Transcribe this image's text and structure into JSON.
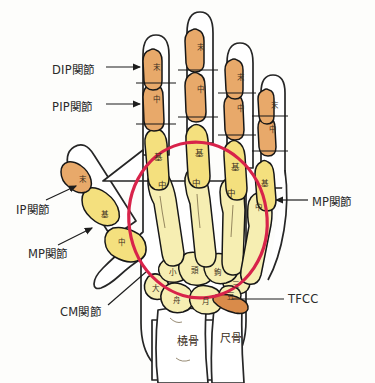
{
  "figure": {
    "colors": {
      "background": "#fdfdfb",
      "bone_pale_yellow": "#f6eeb2",
      "bone_yellow": "#f4e07e",
      "phalanx_orange": "#e8a96a",
      "tfcc_orange": "#d98b4a",
      "outline": "#171717",
      "skin_outline": "#262626",
      "highlight_circle": "#d8234a",
      "label_text": "#2b2b2b",
      "bone_tag_text": "#3a2d20",
      "leader_line": "#1d1d1d"
    }
  },
  "callouts": [
    {
      "id": "dip",
      "label": "DIP関節",
      "text_x": 52,
      "text_y": 70,
      "leader": "arrow-right"
    },
    {
      "id": "pip",
      "label": "PIP関節",
      "text_x": 52,
      "text_y": 107,
      "leader": "arrow-right"
    },
    {
      "id": "ip",
      "label": "IP関節",
      "text_x": 18,
      "text_y": 210,
      "leader": "arrow-up-right"
    },
    {
      "id": "mp_thumb",
      "label": "MP関節",
      "text_x": 30,
      "text_y": 253,
      "leader": "arrow-up-right"
    },
    {
      "id": "cm",
      "label": "CM関節",
      "text_x": 62,
      "text_y": 312,
      "leader": "line-up-right"
    },
    {
      "id": "mp_little",
      "label": "MP関節",
      "text_x": 312,
      "text_y": 205,
      "leader": "arrow-left"
    },
    {
      "id": "tfcc",
      "label": "TFCC",
      "text_x": 288,
      "text_y": 303,
      "leader": "line-left"
    }
  ],
  "bone_tags": [
    {
      "id": "index-distal",
      "label": "末",
      "x": 156,
      "y": 66,
      "size": "tag-sm"
    },
    {
      "id": "index-middle",
      "label": "中",
      "x": 156,
      "y": 98,
      "size": "tag-sm"
    },
    {
      "id": "index-proximal",
      "label": "基",
      "x": 158,
      "y": 156,
      "size": "tag-md"
    },
    {
      "id": "index-meta",
      "label": "中",
      "x": 162,
      "y": 184,
      "size": "tag-md"
    },
    {
      "id": "middle-distal",
      "label": "末",
      "x": 200,
      "y": 46,
      "size": "tag-sm"
    },
    {
      "id": "middle-middle",
      "label": "中",
      "x": 200,
      "y": 88,
      "size": "tag-sm"
    },
    {
      "id": "middle-proximal",
      "label": "基",
      "x": 199,
      "y": 152,
      "size": "tag-md"
    },
    {
      "id": "middle-meta",
      "label": "中",
      "x": 196,
      "y": 182,
      "size": "tag-md"
    },
    {
      "id": "ring-distal",
      "label": "末",
      "x": 240,
      "y": 76,
      "size": "tag-sm"
    },
    {
      "id": "ring-middle",
      "label": "中",
      "x": 240,
      "y": 107,
      "size": "tag-sm"
    },
    {
      "id": "ring-proximal",
      "label": "基",
      "x": 235,
      "y": 166,
      "size": "tag-md"
    },
    {
      "id": "ring-meta",
      "label": "中",
      "x": 231,
      "y": 192,
      "size": "tag-md"
    },
    {
      "id": "little-distal",
      "label": "末",
      "x": 274,
      "y": 104,
      "size": "tag-sm"
    },
    {
      "id": "little-middle",
      "label": "中",
      "x": 272,
      "y": 128,
      "size": "tag-sm"
    },
    {
      "id": "little-proximal",
      "label": "基",
      "x": 264,
      "y": 182,
      "size": "tag-sm"
    },
    {
      "id": "little-meta",
      "label": "中",
      "x": 258,
      "y": 206,
      "size": "tag-sm"
    },
    {
      "id": "thumb-distal",
      "label": "末",
      "x": 82,
      "y": 178,
      "size": "tag-sm"
    },
    {
      "id": "thumb-proximal",
      "label": "基",
      "x": 104,
      "y": 213,
      "size": "tag-sm"
    },
    {
      "id": "thumb-meta",
      "label": "中",
      "x": 121,
      "y": 241,
      "size": "tag-sm"
    },
    {
      "id": "trapezoid",
      "label": "小",
      "x": 172,
      "y": 271,
      "size": "tag-sm"
    },
    {
      "id": "capitate",
      "label": "頭",
      "x": 194,
      "y": 269,
      "size": "tag-sm"
    },
    {
      "id": "hamate",
      "label": "鉤",
      "x": 217,
      "y": 271,
      "size": "tag-sm"
    },
    {
      "id": "triquetrum",
      "label": "三",
      "x": 235,
      "y": 283,
      "size": "tag-sm"
    },
    {
      "id": "pisiform",
      "label": "豆",
      "x": 230,
      "y": 295,
      "size": "tag-sm"
    },
    {
      "id": "trapezium",
      "label": "大",
      "x": 155,
      "y": 287,
      "size": "tag-sm"
    },
    {
      "id": "scaphoid",
      "label": "舟",
      "x": 176,
      "y": 299,
      "size": "tag-sm"
    },
    {
      "id": "lunate",
      "label": "月",
      "x": 205,
      "y": 300,
      "size": "tag-sm"
    },
    {
      "id": "radius",
      "label": "橈骨",
      "x": 188,
      "y": 340,
      "size": "tag-lg"
    },
    {
      "id": "ulna",
      "label": "尺骨",
      "x": 231,
      "y": 337,
      "size": "tag-lg"
    }
  ],
  "highlight": {
    "id": "wrist-region-circle",
    "shape": "ellipse",
    "cx": 198,
    "cy": 220,
    "rx": 69,
    "ry": 78,
    "rotation": -8,
    "stroke": "#d8234a",
    "stroke_width": 3.2
  }
}
